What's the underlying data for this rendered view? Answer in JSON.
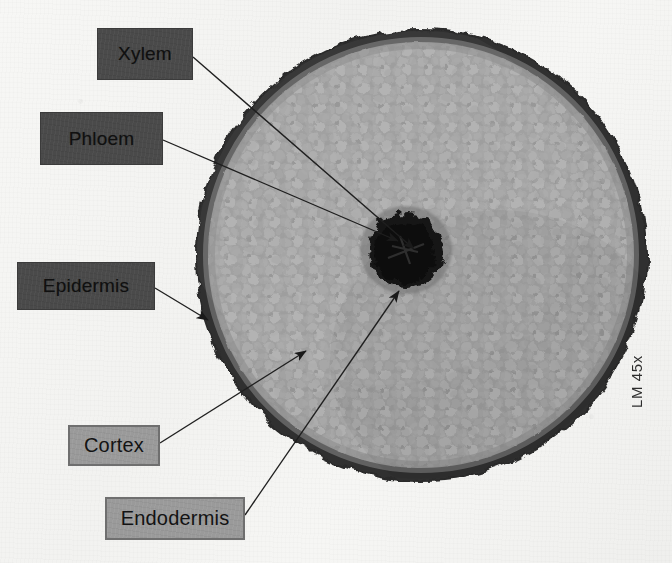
{
  "figure": {
    "background_color": "#f4f4f2",
    "magnification_note": "LM 45x"
  },
  "specimen": {
    "type": "root-cross-section",
    "outline_color": "#2a2a2a",
    "cortex_color": "#9d9d9d",
    "stele_color": "#1d1d1d",
    "center_x": 421,
    "center_y": 255,
    "radius": 227
  },
  "labels": [
    {
      "id": "xylem",
      "text": "Xylem",
      "style": "dark",
      "box_color": "#4a4a4a",
      "text_color": "#101010",
      "font_size": 19,
      "x": 97,
      "y": 28,
      "w": 96,
      "h": 52,
      "leader_from_x": 193,
      "leader_from_y": 57,
      "leader_to_x": 414,
      "leader_to_y": 249
    },
    {
      "id": "phloem",
      "text": "Phloem",
      "style": "dark",
      "box_color": "#4a4a4a",
      "text_color": "#101010",
      "font_size": 19,
      "x": 40,
      "y": 112,
      "w": 123,
      "h": 53,
      "leader_from_x": 163,
      "leader_from_y": 140,
      "leader_to_x": 398,
      "leader_to_y": 241
    },
    {
      "id": "epidermis",
      "text": "Epidermis",
      "style": "dark",
      "box_color": "#4a4a4a",
      "text_color": "#101010",
      "font_size": 19,
      "x": 17,
      "y": 262,
      "w": 138,
      "h": 48,
      "leader_from_x": 155,
      "leader_from_y": 288,
      "leader_to_x": 208,
      "leader_to_y": 320
    },
    {
      "id": "cortex",
      "text": "Cortex",
      "style": "light",
      "box_color": "#9a9a9a",
      "text_color": "#131313",
      "font_size": 20,
      "x": 68,
      "y": 425,
      "w": 92,
      "h": 41,
      "leader_from_x": 160,
      "leader_from_y": 443,
      "leader_to_x": 306,
      "leader_to_y": 351
    },
    {
      "id": "endodermis",
      "text": "Endodermis",
      "style": "light",
      "box_color": "#9a9a9a",
      "text_color": "#131313",
      "font_size": 20,
      "x": 105,
      "y": 497,
      "w": 140,
      "h": 43,
      "leader_from_x": 245,
      "leader_from_y": 515,
      "leader_to_x": 399,
      "leader_to_y": 291
    }
  ]
}
